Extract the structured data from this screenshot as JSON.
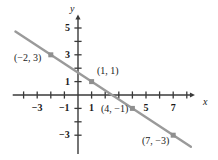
{
  "chart_data": {
    "type": "line",
    "title": "",
    "xlabel": "x",
    "ylabel": "y",
    "grid": false,
    "legend": "none",
    "xlim": [
      -4.8,
      8.6
    ],
    "ylim": [
      -4.4,
      6.0
    ],
    "x_ticks": [
      -4,
      -3,
      -2,
      -1,
      1,
      2,
      3,
      4,
      5,
      6,
      7,
      8
    ],
    "y_ticks": [
      -3,
      -2,
      -1,
      1,
      2,
      3,
      4,
      5
    ],
    "x_tick_labels": [
      {
        "value": -3,
        "text": "−3"
      },
      {
        "value": -1,
        "text": "−1"
      },
      {
        "value": 1,
        "text": "1"
      },
      {
        "value": 5,
        "text": "5"
      },
      {
        "value": 7,
        "text": "7"
      }
    ],
    "y_tick_labels": [
      {
        "value": 5,
        "text": "5"
      },
      {
        "value": 3,
        "text": "3"
      },
      {
        "value": 1,
        "text": "1"
      },
      {
        "value": -3,
        "text": "−3"
      }
    ],
    "series": [
      {
        "name": "line",
        "color": "#9a9a9a",
        "slope": -0.6666666667,
        "intercept": 1.6666666667,
        "x_start": -4.6,
        "x_end": 8.3,
        "points": [
          {
            "x": -2,
            "y": 3,
            "label": "(−2, 3)"
          },
          {
            "x": 1,
            "y": 1,
            "label": "(1, 1)"
          },
          {
            "x": 4,
            "y": -1,
            "label": "(4, −1)"
          },
          {
            "x": 7,
            "y": -3,
            "label": "(7, −3)"
          }
        ]
      }
    ],
    "point_labels": [
      {
        "text": "(−2, 3)",
        "left": 14,
        "top": 53
      },
      {
        "text": "(1, 1)",
        "left": 97,
        "top": 66
      },
      {
        "text": "(4, −1)",
        "left": 101,
        "top": 104
      },
      {
        "text": "(7, −3)",
        "left": 142,
        "top": 136
      }
    ],
    "axis_labels": {
      "x": {
        "text": "x",
        "left": 203,
        "top": 97
      },
      "y": {
        "text": "y",
        "left": 70,
        "top": 4
      }
    },
    "colors": {
      "line": "#9a9a9a",
      "marker": "#8f8f8f",
      "axis": "#3a3a3a",
      "text": "#1a1a1a",
      "background": "#ffffff"
    }
  }
}
